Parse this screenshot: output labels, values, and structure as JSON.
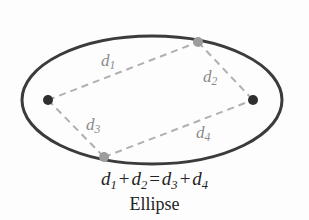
{
  "figure": {
    "caption": "Ellipse",
    "equation": {
      "term1": "d",
      "term1_sub": "1",
      "plus1": "+",
      "term2": "d",
      "term2_sub": "2",
      "equals": "=",
      "term3": "d",
      "term3_sub": "3",
      "plus2": "+",
      "term4": "d",
      "term4_sub": "4",
      "full_text": "d1 + d2 = d3 + d4"
    },
    "labels": [
      {
        "name": "d1",
        "base": "d",
        "sub": "1",
        "x": 101,
        "y": 52
      },
      {
        "name": "d2",
        "base": "d",
        "sub": "2",
        "x": 203,
        "y": 68
      },
      {
        "name": "d3",
        "base": "d",
        "sub": "3",
        "x": 86,
        "y": 116
      },
      {
        "name": "d4",
        "base": "d",
        "sub": "4",
        "x": 196,
        "y": 124
      }
    ],
    "colors": {
      "ellipse_stroke": "#3b3b3b",
      "dashed_segment": "#b0b0b0",
      "focus_point": "#2f2f2f",
      "ellipse_point": "#9c9c9c",
      "text": "#232323",
      "label_text": "#8a8a8a",
      "background": "#fdfdfd"
    },
    "geometry": {
      "ellipse": {
        "cx": 152,
        "cy": 100,
        "rx": 130,
        "ry": 64,
        "stroke_width": 3
      },
      "focus_left": {
        "x": 48,
        "y": 100,
        "r": 5
      },
      "focus_right": {
        "x": 253,
        "y": 100,
        "r": 5
      },
      "point_top": {
        "x": 198,
        "y": 42,
        "r": 5
      },
      "point_bottom": {
        "x": 104,
        "y": 157,
        "r": 5
      },
      "segments": [
        {
          "name": "d1",
          "x1": 48,
          "y1": 100,
          "x2": 198,
          "y2": 42
        },
        {
          "name": "d2",
          "x1": 198,
          "y1": 42,
          "x2": 253,
          "y2": 100
        },
        {
          "name": "d3",
          "x1": 48,
          "y1": 100,
          "x2": 104,
          "y2": 157
        },
        {
          "name": "d4",
          "x1": 104,
          "y1": 157,
          "x2": 253,
          "y2": 100
        }
      ]
    }
  }
}
